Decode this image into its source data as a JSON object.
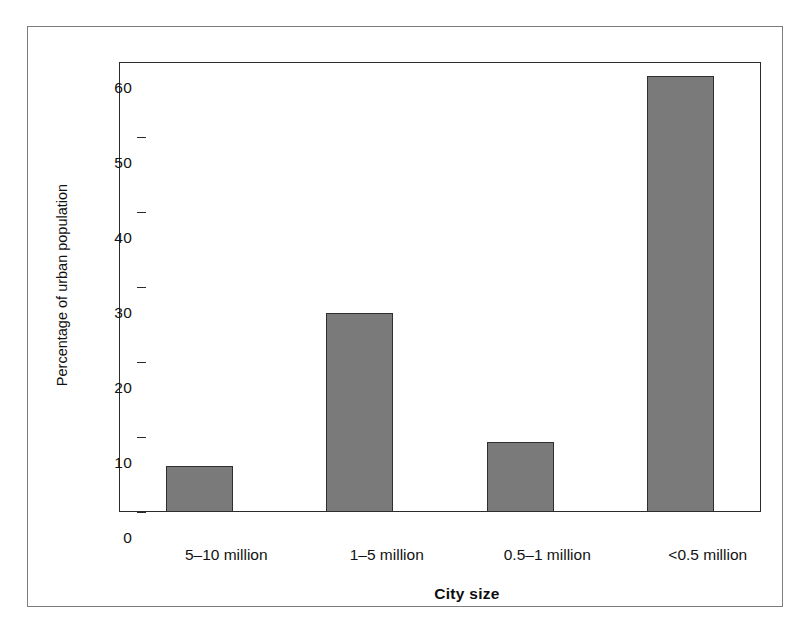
{
  "chart_data": {
    "type": "bar",
    "title": "",
    "subtitle": "",
    "xlabel": "City size",
    "ylabel": "Percentage of urban population",
    "categories": [
      "5–10 million",
      "1–5 million",
      "0.5–1 million",
      "<0.5 million"
    ],
    "values": [
      6.1,
      26.6,
      9.3,
      58.2
    ],
    "series": [
      {
        "name": "Percentage of urban population",
        "values": [
          6.1,
          26.6,
          9.3,
          58.2
        ]
      }
    ],
    "ylim": [
      0,
      60
    ],
    "ytick_labels": [
      "60",
      "50",
      "40",
      "30",
      "20",
      "10",
      "0"
    ],
    "ytick_values": [
      60,
      50,
      40,
      30,
      20,
      10,
      0
    ],
    "xlim_note": "categorical",
    "grid": false,
    "legend": false,
    "legend_position": "none",
    "bar_color": "#7a7a7a",
    "bar_edge_color": "#2f2f2f",
    "axis_color": "#2b2b2b",
    "frame_color": "#7d7d7d",
    "background": "#ffffff"
  },
  "axes": {
    "y_title": "Percentage of urban population",
    "x_title": "City size"
  },
  "ticks": {
    "y": [
      {
        "label": "60",
        "value": 60
      },
      {
        "label": "50",
        "value": 50
      },
      {
        "label": "40",
        "value": 40
      },
      {
        "label": "30",
        "value": 30
      },
      {
        "label": "20",
        "value": 20
      },
      {
        "label": "10",
        "value": 10
      },
      {
        "label": "0",
        "value": 0
      }
    ],
    "x": [
      {
        "label": "5–10 million"
      },
      {
        "label": "1–5 million"
      },
      {
        "label": "0.5–1 million"
      },
      {
        "label": "<0.5 million"
      }
    ]
  }
}
